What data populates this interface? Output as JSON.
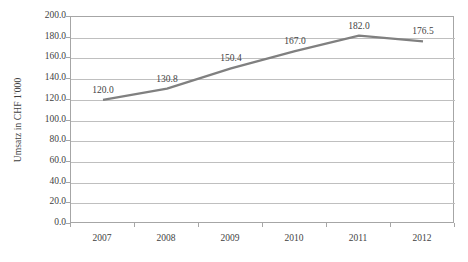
{
  "chart_data": {
    "type": "line",
    "title": "",
    "xlabel": "",
    "ylabel": "Umsatz in CHF 1'000",
    "categories": [
      "2007",
      "2008",
      "2009",
      "2010",
      "2011",
      "2012"
    ],
    "values": [
      120.0,
      130.8,
      150.4,
      167.0,
      182.0,
      176.5
    ],
    "point_labels": [
      "120.0",
      "130.8",
      "150.4",
      "167.0",
      "182.0",
      "176.5"
    ],
    "ylim": [
      0.0,
      200.0
    ],
    "ytick_step": 20.0,
    "ytick_labels": [
      "200.0",
      "180.0",
      "160.0",
      "140.0",
      "120.0",
      "100.0",
      "80.0",
      "60.0",
      "40.0",
      "20.0",
      "0.0"
    ],
    "ytick_values": [
      200.0,
      180.0,
      160.0,
      140.0,
      120.0,
      100.0,
      80.0,
      60.0,
      40.0,
      20.0,
      0.0
    ],
    "grid": true,
    "legend": false,
    "series": [
      {
        "name": "Umsatz",
        "values": [
          120.0,
          130.8,
          150.4,
          167.0,
          182.0,
          176.5
        ],
        "color": "#808080",
        "markers": false,
        "line_width": 2.2
      }
    ],
    "colors": {
      "line": "#808080",
      "grid": "#bfbfbf",
      "axis": "#a6a6a6",
      "text": "#3f3f3f",
      "background": "#ffffff"
    }
  },
  "layout": {
    "plot_left": 70,
    "plot_top": 16,
    "plot_width": 384,
    "plot_height": 207,
    "point_inset": 0.5
  }
}
